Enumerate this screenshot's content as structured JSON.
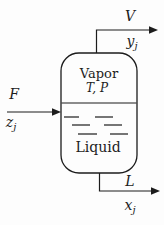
{
  "diagram": {
    "kind": "flash-drum-separator",
    "colors": {
      "line": "#1c1c1c",
      "background": "#fdfdfd"
    },
    "vessel": {
      "vapor_label": "Vapor",
      "conditions_label": "T, P",
      "liquid_label": "Liquid"
    },
    "streams": {
      "vapor": {
        "flow_label": "V",
        "comp_base": "y",
        "comp_sub": "j"
      },
      "feed": {
        "flow_label": "F",
        "comp_base": "z",
        "comp_sub": "j"
      },
      "liquid": {
        "flow_label": "L",
        "comp_base": "x",
        "comp_sub": "j"
      }
    }
  }
}
